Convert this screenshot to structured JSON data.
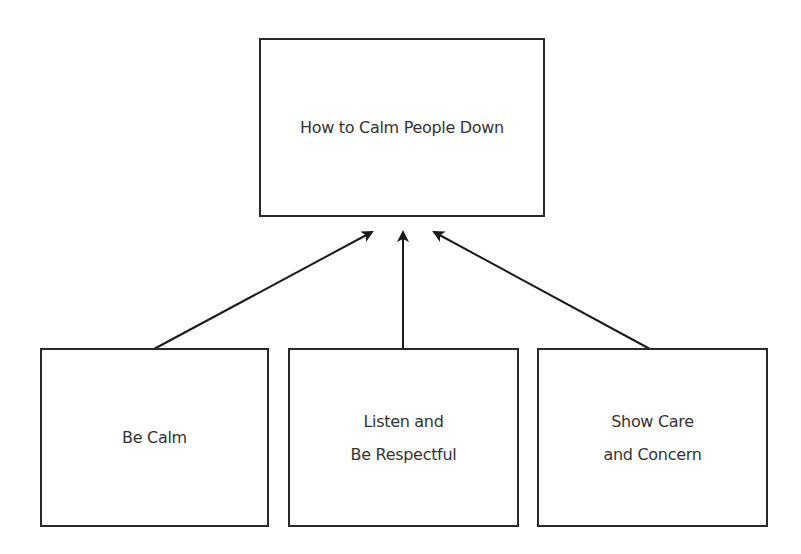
{
  "diagram": {
    "top": {
      "label": "How to Calm People Down"
    },
    "children": [
      {
        "label": "Be Calm"
      },
      {
        "label": "Listen and\nBe Respectful"
      },
      {
        "label": "Show Care\nand Concern"
      }
    ],
    "edges": [
      {
        "from": "Be Calm",
        "to": "How to Calm People Down"
      },
      {
        "from": "Listen and Be Respectful",
        "to": "How to Calm People Down"
      },
      {
        "from": "Show Care and Concern",
        "to": "How to Calm People Down"
      }
    ]
  }
}
